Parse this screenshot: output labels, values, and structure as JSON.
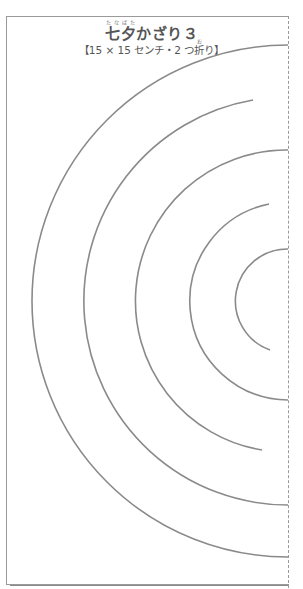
{
  "title": {
    "kanji": "七夕",
    "ruby": "たなばた",
    "rest": "かざり３"
  },
  "subtitle": {
    "before": "【15 × 15 センチ・2 つ",
    "kanji": "折",
    "ruby": "お",
    "after": "り】"
  },
  "template": {
    "fold_line": "dashed",
    "center": [
      288,
      301
    ],
    "arcs": [
      {
        "radius": 52,
        "from": "fold",
        "to": "open-bottom"
      },
      {
        "radius": 99,
        "from": "open-top",
        "to": "fold"
      },
      {
        "radius": 151,
        "from": "fold",
        "to": "open-bottom"
      },
      {
        "radius": 204,
        "from": "open-top",
        "to": "fold"
      },
      {
        "radius": 256,
        "from": "fold",
        "to": "fold"
      }
    ],
    "line_color": "#8a8a8a"
  }
}
